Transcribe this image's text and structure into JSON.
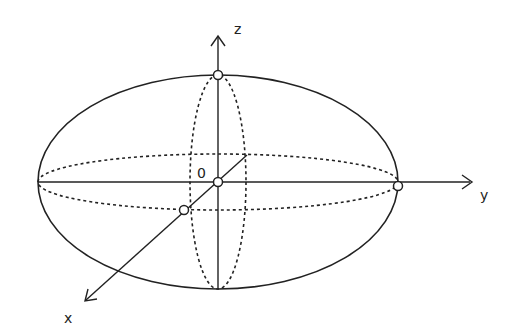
{
  "diagram": {
    "type": "ellipsoid-3d-axes",
    "axes": {
      "x": {
        "label": "x"
      },
      "y": {
        "label": "y"
      },
      "z": {
        "label": "z"
      }
    },
    "origin_label": "0",
    "colors": {
      "stroke": "#222222",
      "background": "#ffffff"
    }
  }
}
